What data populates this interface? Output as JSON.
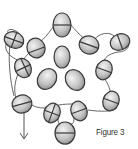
{
  "figure": {
    "caption": "Figure 3",
    "colors": {
      "bead_fill": "#c9c9c9",
      "bead_stroke": "#3a3a3a",
      "thread": "#555555",
      "background": "#ffffff"
    },
    "beads": [
      {
        "id": "top",
        "cx": 62,
        "cy": 25,
        "rx": 9,
        "ry": 12,
        "rot": 0,
        "crossed": true
      },
      {
        "id": "upper-left-outer",
        "cx": 14,
        "cy": 40,
        "rx": 10,
        "ry": 8,
        "rot": 20,
        "crossed": true
      },
      {
        "id": "upper-left-inner",
        "cx": 36,
        "cy": 48,
        "rx": 9,
        "ry": 10,
        "rot": -20,
        "crossed": true
      },
      {
        "id": "upper-right-inner",
        "cx": 89,
        "cy": 45,
        "rx": 10,
        "ry": 9,
        "rot": 20,
        "crossed": true
      },
      {
        "id": "upper-right-outer",
        "cx": 120,
        "cy": 42,
        "rx": 10,
        "ry": 8,
        "rot": -20,
        "crossed": true
      },
      {
        "id": "left",
        "cx": 23,
        "cy": 68,
        "rx": 8,
        "ry": 10,
        "rot": -25,
        "crossed": true
      },
      {
        "id": "right",
        "cx": 104,
        "cy": 70,
        "rx": 8,
        "ry": 10,
        "rot": 20,
        "crossed": true
      },
      {
        "id": "center-top",
        "cx": 62,
        "cy": 57,
        "rx": 8,
        "ry": 11,
        "rot": 0,
        "crossed": false
      },
      {
        "id": "center-left",
        "cx": 47,
        "cy": 79,
        "rx": 9,
        "ry": 11,
        "rot": 35,
        "crossed": false
      },
      {
        "id": "center-right",
        "cx": 75,
        "cy": 80,
        "rx": 9,
        "ry": 11,
        "rot": -35,
        "crossed": false
      },
      {
        "id": "lower-left",
        "cx": 22,
        "cy": 104,
        "rx": 10,
        "ry": 9,
        "rot": -15,
        "crossed": true
      },
      {
        "id": "lower-right",
        "cx": 111,
        "cy": 101,
        "rx": 8,
        "ry": 10,
        "rot": 20,
        "crossed": true
      },
      {
        "id": "bottom-left",
        "cx": 52,
        "cy": 113,
        "rx": 8,
        "ry": 10,
        "rot": 20,
        "crossed": true
      },
      {
        "id": "bottom-right",
        "cx": 79,
        "cy": 111,
        "rx": 8,
        "ry": 10,
        "rot": -20,
        "crossed": true
      },
      {
        "id": "bottom",
        "cx": 65,
        "cy": 133,
        "rx": 10,
        "ry": 11,
        "rot": 0,
        "crossed": true
      }
    ],
    "arrow": {
      "from": [
        24,
        112
      ],
      "to": [
        24,
        138
      ],
      "label": "thread direction"
    }
  }
}
